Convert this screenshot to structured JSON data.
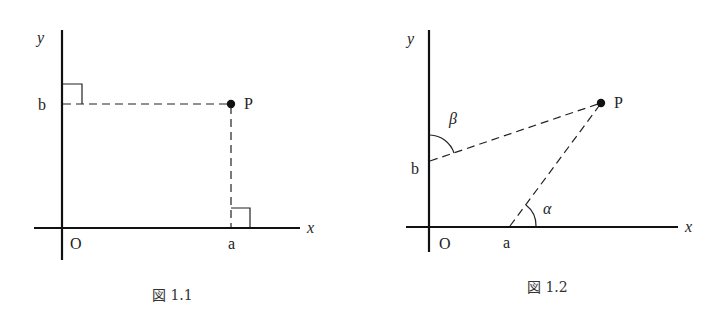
{
  "figures": [
    {
      "id": "fig-1-1",
      "caption": "図 1.1",
      "axis_labels": {
        "x": "x",
        "y": "y"
      },
      "origin_label": "O",
      "point": {
        "label": "P"
      },
      "tick_labels": {
        "x": "a",
        "y": "b"
      },
      "description": "Point P with perpendicular dashed projections to the x-axis at a and y-axis at b, with right-angle marks"
    },
    {
      "id": "fig-1-2",
      "caption": "図 1.2",
      "axis_labels": {
        "x": "x",
        "y": "y"
      },
      "origin_label": "O",
      "point": {
        "label": "P"
      },
      "tick_labels": {
        "x": "a",
        "y": "b"
      },
      "angle_labels": {
        "alpha": "α",
        "beta": "β"
      },
      "description": "Point P connected by dashed lines to a on the x-axis and b on the y-axis, with angles α at a and β at b"
    }
  ]
}
